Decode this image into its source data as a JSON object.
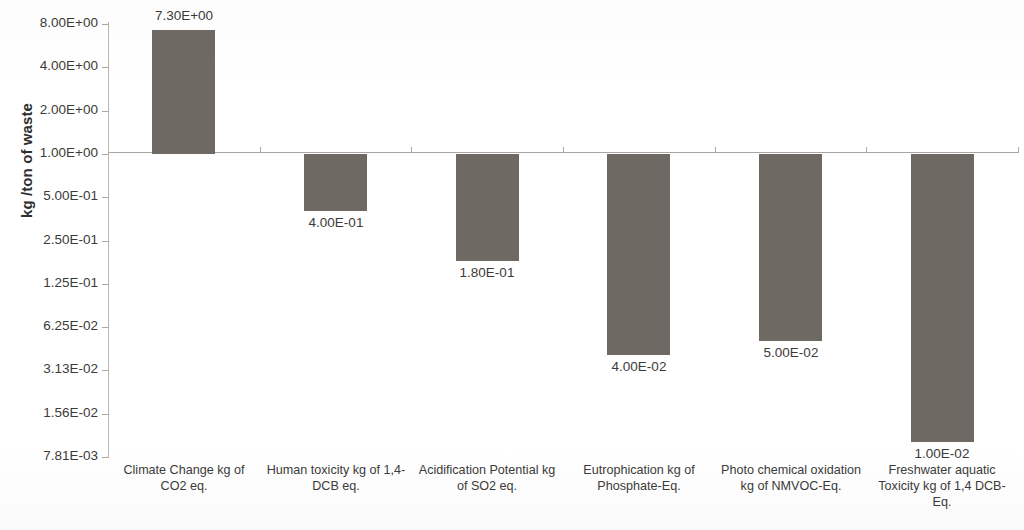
{
  "chart_data": {
    "type": "bar",
    "title": "",
    "subtitle": "",
    "xlabel": "",
    "ylabel": "kg /ton of waste",
    "yscale": "log2",
    "ylim": [
      0.00781,
      8.0
    ],
    "grid": false,
    "legend": false,
    "legend_position": "none",
    "bar_color": "#6e6a63",
    "baseline_value": 1.0,
    "baseline_note": "Bars are drawn from the 1.00E+00 gridline; values above 1 extend up, values below 1 extend down.",
    "y_ticks": [
      "8.00E+00",
      "4.00E+00",
      "2.00E+00",
      "1.00E+00",
      "5.00E-01",
      "2.50E-01",
      "1.25E-01",
      "6.25E-02",
      "3.13E-02",
      "1.56E-02",
      "7.81E-03"
    ],
    "y_tick_values": [
      8.0,
      4.0,
      2.0,
      1.0,
      0.5,
      0.25,
      0.125,
      0.0625,
      0.0313,
      0.0156,
      0.00781
    ],
    "categories": [
      "Climate Change kg of CO2 eq.",
      "Human toxicity kg of 1,4- DCB eq.",
      "Acidification Potential kg of SO2 eq.",
      "Eutrophication kg of Phosphate-Eq.",
      "Photo chemical oxidation kg of NMVOC-Eq.",
      "Freshwater aquatic Toxicity  kg of 1,4 DCB-Eq."
    ],
    "values": [
      7.3,
      0.4,
      0.18,
      0.04,
      0.05,
      0.01
    ],
    "data_labels": [
      "7.30E+00",
      "4.00E-01",
      "1.80E-01",
      "4.00E-02",
      "5.00E-02",
      "1.00E-02"
    ]
  }
}
